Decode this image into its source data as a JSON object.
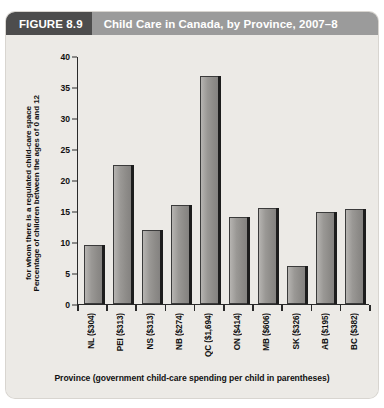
{
  "figure": {
    "tab_label": "FIGURE 8.9",
    "title": "Child Care in Canada, by Province, 2007–8"
  },
  "colors": {
    "tab_background": "#4d4d4d",
    "titlebar_background": "#9b9b9b",
    "panel_background": "#eceae6",
    "bar_fill": "#9a9895",
    "bar_edge": "#3b3b3b",
    "bar_shadow": "#1d1d1d",
    "axis": "#2a2a2a",
    "text": "#111111"
  },
  "chart_data": {
    "type": "bar",
    "title": "Child Care in Canada, by Province, 2007–8",
    "xlabel": "Province (government child-care spending per child in parentheses)",
    "ylabel_line1": "Percentage of children between the ages of 0 and 12",
    "ylabel_line2": "for whom there is a regulated child-care space",
    "categories": [
      "NL ($304)",
      "PEI ($313)",
      "NS ($313)",
      "NB ($274)",
      "QC ($1,694)",
      "ON ($414)",
      "MB ($606)",
      "SK ($326)",
      "AB ($195)",
      "BC ($382)"
    ],
    "values": [
      9.5,
      22.5,
      12.0,
      16.0,
      36.7,
      14.1,
      15.5,
      6.1,
      14.8,
      15.4
    ],
    "ylim": [
      0,
      40
    ],
    "yticks": [
      0,
      5,
      10,
      15,
      20,
      25,
      30,
      35,
      40
    ],
    "ytick_labels": [
      "0",
      "5",
      "10",
      "15",
      "20",
      "25",
      "30",
      "35",
      "40"
    ],
    "grid": false,
    "legend": null
  }
}
